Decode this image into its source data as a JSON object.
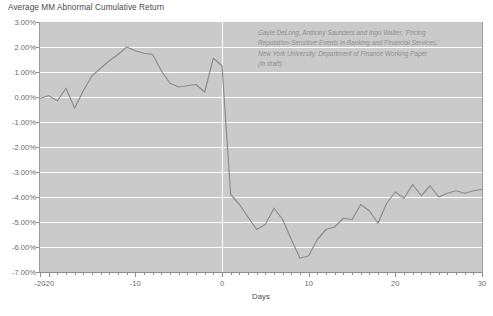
{
  "chart_data": {
    "type": "line",
    "title": "Average MM Abnormal Cumulative Return",
    "xlabel": "Days",
    "ylabel": "",
    "xlim": [
      -21,
      30
    ],
    "ylim": [
      -7,
      3
    ],
    "grid": true,
    "legend": "none",
    "y_tick_labels": [
      "3.00%",
      "2.00%",
      "1.00%",
      "0.00%",
      "-1.00%",
      "-2.00%",
      "-3.00%",
      "-4.00%",
      "-5.00%",
      "-6.00%",
      "-7.00%"
    ],
    "y_tick_values": [
      3,
      2,
      1,
      0,
      -1,
      -2,
      -3,
      -4,
      -5,
      -6,
      -7
    ],
    "x_tick_labels": [
      "-20",
      "-20",
      "-10",
      "0",
      "10",
      "20",
      "30"
    ],
    "x_tick_values": [
      -21,
      -20,
      -10,
      0,
      10,
      20,
      30
    ],
    "annotations": [
      "Gayle DeLong, Anthony Saunders and Ingo Walter, 'Pricing",
      "Reputation-Sensitive Events in Banking and Financial Services,'",
      "New York University, Department of Finance Working Paper",
      "(in draft)"
    ],
    "series": [
      {
        "name": "Average MM Abnormal Cumulative Return",
        "color": "#8c8c8c",
        "x": [
          -21,
          -20,
          -19,
          -18,
          -17,
          -16,
          -15,
          -14,
          -13,
          -12,
          -11,
          -10,
          -9,
          -8,
          -7,
          -6,
          -5,
          -4,
          -3,
          -2,
          -1,
          0,
          1,
          2,
          3,
          4,
          5,
          6,
          7,
          8,
          9,
          10,
          11,
          12,
          13,
          14,
          15,
          16,
          17,
          18,
          19,
          20,
          21,
          22,
          23,
          24,
          25,
          26,
          27,
          28,
          29,
          30
        ],
        "y": [
          -0.05,
          0.05,
          -0.15,
          0.35,
          -0.45,
          0.25,
          0.85,
          1.15,
          1.45,
          1.7,
          2.0,
          1.85,
          1.75,
          1.7,
          1.05,
          0.55,
          0.4,
          0.45,
          0.5,
          0.2,
          1.55,
          1.25,
          -3.9,
          -4.3,
          -4.8,
          -5.3,
          -5.1,
          -4.45,
          -4.9,
          -5.7,
          -6.45,
          -6.35,
          -5.7,
          -5.3,
          -5.2,
          -4.85,
          -4.9,
          -4.3,
          -4.55,
          -5.05,
          -4.25,
          -3.8,
          -4.05,
          -3.5,
          -3.95,
          -3.55,
          -4.0,
          -3.85,
          -3.75,
          -3.85,
          -3.75,
          -3.7
        ]
      }
    ]
  },
  "colors": {
    "plot_background": "#cacaca",
    "gridline": "#ffffff",
    "line": "#8c8c8c",
    "text": "#6b6b6b"
  }
}
